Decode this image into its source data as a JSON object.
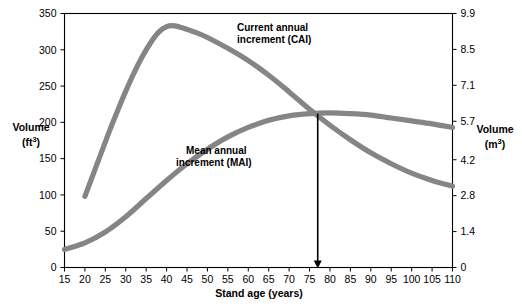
{
  "chart_data": {
    "type": "line",
    "title": "",
    "xlabel": "Stand age (years)",
    "ylabel": "Volume\n(ft3)",
    "ylabel_right": "Volume\n(m3)",
    "xlim": [
      15,
      110
    ],
    "ylim": [
      0,
      350
    ],
    "ylim_right": [
      0,
      9.9
    ],
    "grid": false,
    "legend": "inline-annotations",
    "xticks": [
      15,
      20,
      25,
      30,
      35,
      40,
      45,
      50,
      55,
      60,
      65,
      70,
      75,
      80,
      85,
      90,
      95,
      100,
      105,
      110
    ],
    "yticks_left": [
      0,
      50,
      100,
      150,
      200,
      250,
      300,
      350
    ],
    "yticks_right": [
      "0",
      "1.4",
      "2.8",
      "4.2",
      "5.7",
      "7.1",
      "8.5",
      "9.9"
    ],
    "yticks_right_values": [
      0,
      1.4,
      2.8,
      4.2,
      5.7,
      7.1,
      8.5,
      9.9
    ],
    "series": [
      {
        "name": "Current annual increment (CAI)",
        "label_line1": "Current annual",
        "label_line2": "increment (CAI)",
        "color": "#858585",
        "x": [
          20,
          22,
          24,
          26,
          28,
          30,
          32,
          34,
          36,
          38,
          40,
          42,
          44,
          46,
          48,
          50,
          55,
          60,
          65,
          70,
          75,
          80,
          85,
          90,
          95,
          100,
          105,
          110
        ],
        "y": [
          98,
          128,
          158,
          188,
          216,
          243,
          268,
          290,
          309,
          324,
          332,
          333,
          330,
          326,
          322,
          317,
          302,
          285,
          265,
          242,
          218,
          196,
          176,
          158,
          143,
          130,
          120,
          112
        ]
      },
      {
        "name": "Mean annual increment (MAI)",
        "label_line1": "Mean annual",
        "label_line2": "increment (MAI)",
        "color": "#858585",
        "x": [
          15,
          20,
          25,
          30,
          35,
          40,
          45,
          50,
          55,
          60,
          65,
          70,
          75,
          80,
          85,
          90,
          95,
          100,
          105,
          110
        ],
        "y": [
          25,
          34,
          49,
          70,
          95,
          120,
          143,
          163,
          180,
          193,
          203,
          209,
          212,
          213,
          212,
          210,
          206,
          202,
          198,
          193
        ]
      }
    ],
    "annotations": [
      {
        "name": "rotation-age-arrow",
        "type": "vertical-arrow",
        "x": 77,
        "y_top": 212,
        "y_bottom": 0,
        "color": "#000000"
      }
    ]
  },
  "axes": {
    "left_title_line1": "Volume",
    "left_title_line2_pre": "(ft",
    "left_title_line2_sup": "3",
    "left_title_line2_post": ")",
    "right_title_line1": "Volume",
    "right_title_line2_pre": "(m",
    "right_title_line2_sup": "3",
    "right_title_line2_post": ")",
    "x_title": "Stand age (years)"
  }
}
